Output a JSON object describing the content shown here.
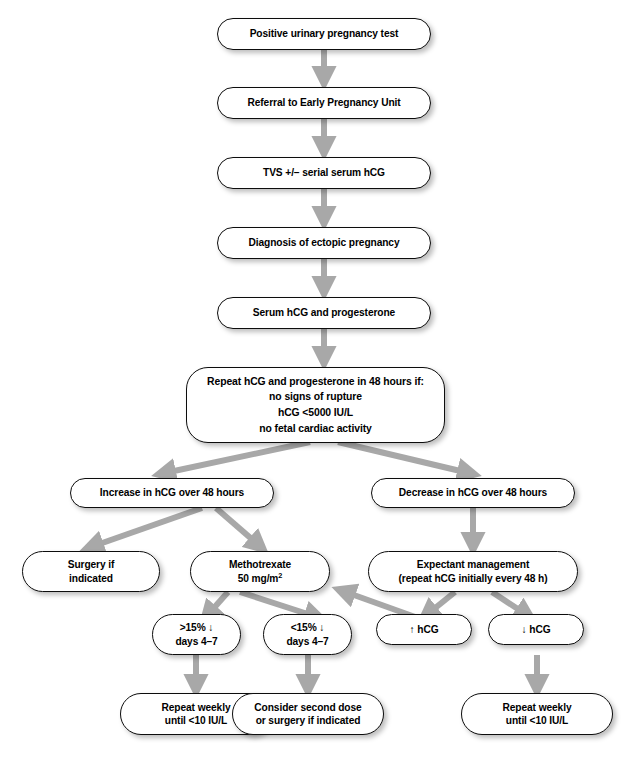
{
  "diagram": {
    "arrow_color": "#a8a8a8",
    "box_border_color": "#0d0d0d",
    "box_fill_color": "#ffffff",
    "text_color": "#000000",
    "nodes": {
      "positive_test": "Positive urinary pregnancy test",
      "referral": "Referral to Early Pregnancy Unit",
      "tvs": "TVS +/– serial serum hCG",
      "diagnosis": "Diagnosis of ectopic pregnancy",
      "serum": "Serum hCG and progesterone",
      "repeat_48h_line1": "Repeat hCG and progesterone in 48 hours if:",
      "repeat_48h_line2": "no signs of rupture",
      "repeat_48h_line3": "hCG <5000 IU/L",
      "repeat_48h_line4": "no fetal cardiac activity",
      "increase": "Increase in hCG over 48 hours",
      "decrease": "Decrease in hCG over 48 hours",
      "surgery": "Surgery if\nindicated",
      "methotrexate_line1": "Methotrexate",
      "methotrexate_line2_pre": "50 mg/m",
      "methotrexate_line2_sup": "2",
      "expectant_line1": "Expectant management",
      "expectant_line2": "(repeat hCG initially every 48 h)",
      "drop_over_15": ">15% ↓\ndays 4–7",
      "drop_under_15": "<15% ↓\ndays 4–7",
      "hcg_up": "↑ hCG",
      "hcg_down": "↓ hCG",
      "repeat_weekly_left": "Repeat weekly\nuntil <10 IU/L",
      "consider_second": "Consider second dose\nor surgery if indicated",
      "repeat_weekly_right": "Repeat weekly\nuntil <10 IU/L"
    }
  }
}
